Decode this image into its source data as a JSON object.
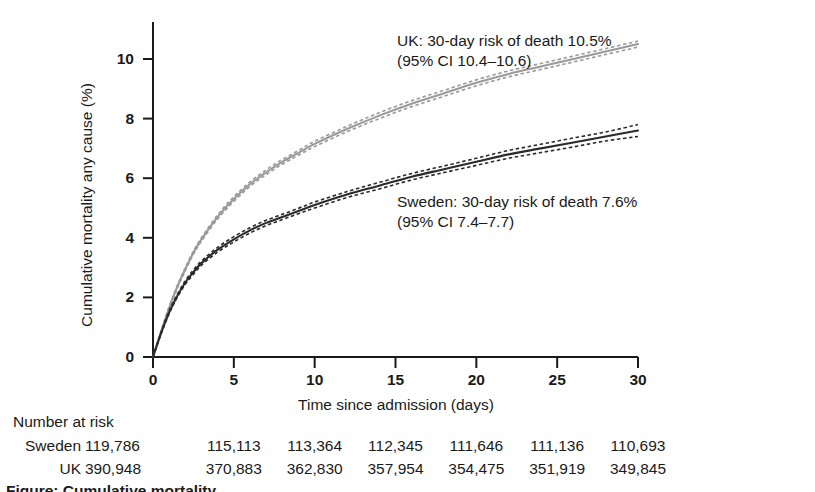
{
  "chart_data": {
    "type": "line",
    "title": "",
    "xlabel": "Time since admission (days)",
    "ylabel": "Cumulative mortality any cause (%)",
    "xlim": [
      0,
      30
    ],
    "ylim": [
      0,
      11
    ],
    "xticks": [
      "0",
      "5",
      "10",
      "15",
      "20",
      "25",
      "30"
    ],
    "xtick_values": [
      0,
      5,
      10,
      15,
      20,
      25,
      30
    ],
    "yticks": [
      "0",
      "2",
      "4",
      "6",
      "8",
      "10"
    ],
    "ytick_values": [
      0,
      2,
      4,
      6,
      8,
      10
    ],
    "grid": false,
    "legend_position": "inline-annotations",
    "x": [
      0,
      0.5,
      1,
      1.5,
      2,
      2.5,
      3,
      4,
      5,
      6,
      7,
      8,
      9,
      10,
      12,
      14,
      16,
      18,
      20,
      22,
      24,
      26,
      28,
      30
    ],
    "series": [
      {
        "name": "UK",
        "color": "#9a9a9a",
        "style": "solid",
        "values": [
          0,
          0.85,
          1.65,
          2.35,
          2.95,
          3.5,
          3.95,
          4.7,
          5.3,
          5.8,
          6.2,
          6.55,
          6.85,
          7.15,
          7.65,
          8.1,
          8.5,
          8.85,
          9.2,
          9.5,
          9.75,
          10.0,
          10.25,
          10.5
        ],
        "ci_lower": [
          0,
          0.82,
          1.6,
          2.3,
          2.9,
          3.44,
          3.89,
          4.63,
          5.22,
          5.72,
          6.12,
          6.47,
          6.77,
          7.06,
          7.56,
          8.0,
          8.4,
          8.75,
          9.1,
          9.4,
          9.65,
          9.9,
          10.15,
          10.4
        ],
        "ci_upper": [
          0,
          0.88,
          1.7,
          2.4,
          3.0,
          3.56,
          4.01,
          4.77,
          5.38,
          5.88,
          6.28,
          6.63,
          6.93,
          7.24,
          7.74,
          8.2,
          8.6,
          8.95,
          9.3,
          9.6,
          9.85,
          10.1,
          10.35,
          10.6
        ]
      },
      {
        "name": "Sweden",
        "color": "#2b2b2b",
        "style": "solid",
        "values": [
          0,
          0.8,
          1.5,
          2.05,
          2.5,
          2.85,
          3.15,
          3.6,
          3.95,
          4.25,
          4.5,
          4.7,
          4.9,
          5.1,
          5.45,
          5.75,
          6.05,
          6.3,
          6.55,
          6.8,
          7.0,
          7.2,
          7.4,
          7.6
        ],
        "ci_lower": [
          0,
          0.77,
          1.45,
          2.0,
          2.44,
          2.78,
          3.08,
          3.52,
          3.86,
          4.16,
          4.41,
          4.61,
          4.81,
          5.0,
          5.35,
          5.64,
          5.94,
          6.19,
          6.43,
          6.67,
          6.86,
          7.05,
          7.25,
          7.4
        ],
        "ci_upper": [
          0,
          0.83,
          1.55,
          2.1,
          2.56,
          2.92,
          3.22,
          3.68,
          4.04,
          4.34,
          4.59,
          4.79,
          4.99,
          5.2,
          5.55,
          5.86,
          6.16,
          6.41,
          6.67,
          6.93,
          7.14,
          7.35,
          7.55,
          7.8
        ]
      }
    ],
    "annotations": [
      {
        "id": "uk",
        "line1": "UK: 30-day risk of death 10.5%",
        "line2": "(95% CI 10.4–10.6)"
      },
      {
        "id": "sweden",
        "line1": "Sweden: 30-day risk of death 7.6%",
        "line2": "(95% CI 7.4–7.7)"
      }
    ],
    "risk_table": {
      "title": "Number at risk",
      "time_points": [
        0,
        5,
        10,
        15,
        20,
        25,
        30
      ],
      "rows": [
        {
          "label": "Sweden",
          "values": [
            "119,786",
            "115,113",
            "113,364",
            "112,345",
            "111,646",
            "111,136",
            "110,693"
          ]
        },
        {
          "label": "UK",
          "values": [
            "390,948",
            "370,883",
            "362,830",
            "357,954",
            "354,475",
            "351,919",
            "349,845"
          ]
        }
      ]
    },
    "caption": "Figure: Cumulative mortality"
  }
}
